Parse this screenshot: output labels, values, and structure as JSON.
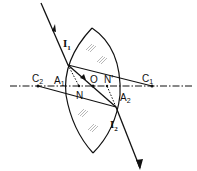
{
  "diagram": {
    "type": "optics-ray-diagram",
    "colors": {
      "ink": "#111111",
      "background": "#ffffff",
      "hatch": "#999999"
    },
    "labels": {
      "I1": {
        "main": "I",
        "sub": "1"
      },
      "I2": {
        "main": "I",
        "sub": "2"
      },
      "C1": {
        "main": "C",
        "sub": "1"
      },
      "C2": {
        "main": "C",
        "sub": "2"
      },
      "A1": {
        "main": "A",
        "sub": "1"
      },
      "A2": {
        "main": "A",
        "sub": "2"
      },
      "O": {
        "main": "O"
      },
      "N_upper": {
        "main": "N"
      },
      "N_prime": {
        "main": "N'"
      },
      "N_lower": {
        "main": "N"
      }
    }
  }
}
